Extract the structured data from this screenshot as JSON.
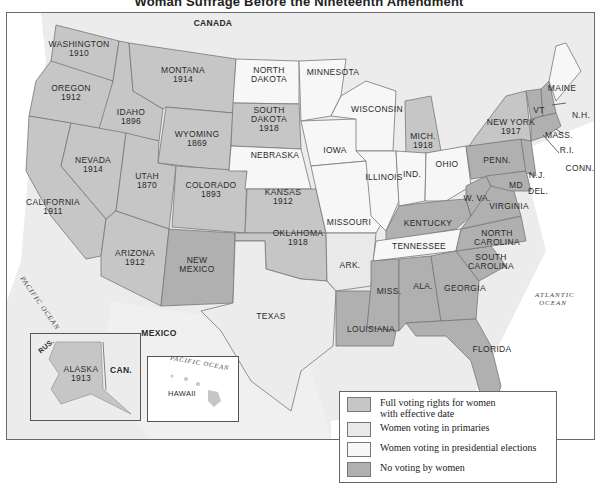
{
  "title": "Woman Suffrage Before the Nineteenth Amendment",
  "colors": {
    "full": "#c6c6c6",
    "primaries": "#e9e9e9",
    "presidential": "#f7f7f7",
    "none": "#b0b0b0",
    "foreign": "#ececec",
    "water": "#ffffff"
  },
  "regions": {
    "canada": "CANADA",
    "mexico": "MEXICO",
    "pacific": "PACIFIC OCEAN",
    "atlantic_1": "ATLANTIC",
    "atlantic_2": "OCEAN"
  },
  "states": [
    {
      "name": "WASHINGTON",
      "year": "1910",
      "cat": "full"
    },
    {
      "name": "OREGON",
      "year": "1912",
      "cat": "full"
    },
    {
      "name": "CALIFORNIA",
      "year": "1911",
      "cat": "full"
    },
    {
      "name": "IDAHO",
      "year": "1896",
      "cat": "full"
    },
    {
      "name": "NEVADA",
      "year": "1914",
      "cat": "full"
    },
    {
      "name": "MONTANA",
      "year": "1914",
      "cat": "full"
    },
    {
      "name": "WYOMING",
      "year": "1869",
      "cat": "full"
    },
    {
      "name": "UTAH",
      "year": "1870",
      "cat": "full"
    },
    {
      "name": "COLORADO",
      "year": "1893",
      "cat": "full"
    },
    {
      "name": "ARIZONA",
      "year": "1912",
      "cat": "full"
    },
    {
      "name": "NEW MEXICO",
      "year": "",
      "cat": "none"
    },
    {
      "name": "NORTH DAKOTA",
      "year": "",
      "cat": "presidential"
    },
    {
      "name": "SOUTH DAKOTA",
      "year": "1918",
      "cat": "full"
    },
    {
      "name": "NEBRASKA",
      "year": "",
      "cat": "presidential"
    },
    {
      "name": "KANSAS",
      "year": "1912",
      "cat": "full"
    },
    {
      "name": "OKLAHOMA",
      "year": "1918",
      "cat": "full"
    },
    {
      "name": "TEXAS",
      "year": "",
      "cat": "primaries"
    },
    {
      "name": "MINNESOTA",
      "year": "",
      "cat": "presidential"
    },
    {
      "name": "IOWA",
      "year": "",
      "cat": "presidential"
    },
    {
      "name": "MISSOURI",
      "year": "",
      "cat": "presidential"
    },
    {
      "name": "ARK.",
      "year": "",
      "cat": "primaries"
    },
    {
      "name": "LOUISIANA",
      "year": "",
      "cat": "none"
    },
    {
      "name": "WISCONSIN",
      "year": "",
      "cat": "presidential"
    },
    {
      "name": "ILLINOIS",
      "year": "",
      "cat": "presidential"
    },
    {
      "name": "MICH.",
      "year": "1918",
      "cat": "full"
    },
    {
      "name": "IND.",
      "year": "",
      "cat": "presidential"
    },
    {
      "name": "OHIO",
      "year": "",
      "cat": "presidential"
    },
    {
      "name": "KENTUCKY",
      "year": "",
      "cat": "none"
    },
    {
      "name": "TENNESSEE",
      "year": "",
      "cat": "presidential"
    },
    {
      "name": "MISS.",
      "year": "",
      "cat": "none"
    },
    {
      "name": "ALA.",
      "year": "",
      "cat": "none"
    },
    {
      "name": "GEORGIA",
      "year": "",
      "cat": "none"
    },
    {
      "name": "FLORIDA",
      "year": "",
      "cat": "none"
    },
    {
      "name": "SOUTH CAROLINA",
      "year": "",
      "cat": "none"
    },
    {
      "name": "NORTH CAROLINA",
      "year": "",
      "cat": "none"
    },
    {
      "name": "VIRGINIA",
      "year": "",
      "cat": "none"
    },
    {
      "name": "W. VA.",
      "year": "",
      "cat": "none"
    },
    {
      "name": "MD",
      "year": "",
      "cat": "none"
    },
    {
      "name": "DEL.",
      "year": "",
      "cat": "none"
    },
    {
      "name": "PENN.",
      "year": "",
      "cat": "none"
    },
    {
      "name": "N.J.",
      "year": "",
      "cat": "none"
    },
    {
      "name": "NEW YORK",
      "year": "1917",
      "cat": "full"
    },
    {
      "name": "VT",
      "year": "",
      "cat": "none"
    },
    {
      "name": "N.H.",
      "year": "",
      "cat": "none"
    },
    {
      "name": "MAINE",
      "year": "",
      "cat": "presidential"
    },
    {
      "name": "MASS.",
      "year": "",
      "cat": "none"
    },
    {
      "name": "R.I.",
      "year": "",
      "cat": "presidential"
    },
    {
      "name": "CONN.",
      "year": "",
      "cat": "none"
    }
  ],
  "insets": {
    "alaska": {
      "name": "ALASKA",
      "year": "1913",
      "rus": "RUS.",
      "can": "CAN."
    },
    "hawaii": {
      "name": "HAWAII",
      "ocean": "PACIFIC OCEAN"
    }
  },
  "legend": [
    {
      "label": "Full voting rights for women",
      "label2": "with effective date",
      "swatch": "#c6c6c6"
    },
    {
      "label": "Women voting in primaries",
      "swatch": "#e9e9e9"
    },
    {
      "label": "Women voting in presidential elections",
      "swatch": "#f7f7f7"
    },
    {
      "label": "No voting by women",
      "swatch": "#b0b0b0"
    }
  ]
}
